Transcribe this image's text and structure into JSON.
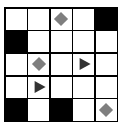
{
  "title": "",
  "colors": {
    "wall": "#000000",
    "floor": "#ffffff",
    "diamond": "#7f7f7f",
    "triangle": "#333333"
  },
  "grid": {
    "rows": 5,
    "cols": 5,
    "cells": [
      [
        "empty",
        "empty",
        "diamond",
        "empty",
        "wall"
      ],
      [
        "wall",
        "empty",
        "empty",
        "empty",
        "empty"
      ],
      [
        "empty",
        "diamond",
        "empty",
        "triangle-right",
        "empty"
      ],
      [
        "empty",
        "triangle-right",
        "empty",
        "empty",
        "empty"
      ],
      [
        "wall",
        "empty",
        "wall",
        "empty",
        "diamond"
      ]
    ]
  }
}
